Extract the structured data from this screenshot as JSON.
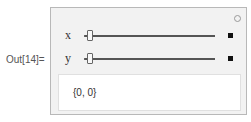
{
  "cell": {
    "out_label": "Out[14]="
  },
  "manipulate": {
    "options_icon": "gear-icon",
    "controls": [
      {
        "label": "x",
        "value": 0,
        "expand_icon": "plus-icon"
      },
      {
        "label": "y",
        "value": 0,
        "expand_icon": "plus-icon"
      }
    ],
    "output": "{0, 0}"
  }
}
